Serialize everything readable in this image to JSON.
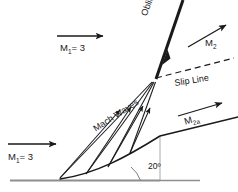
{
  "figure": {
    "background_color": "#ffffff",
    "line_color": "#1a1a1a",
    "ground_color": "#9a9a9a",
    "width": 238,
    "height": 192
  },
  "labels": {
    "mach_upstream_top": {
      "symbol": "M",
      "subscript": "1",
      "value": "= 3",
      "text": "M1 = 3"
    },
    "mach_upstream_bottom": {
      "symbol": "M",
      "subscript": "1",
      "value": "= 3",
      "text": "M1 = 3"
    },
    "mach_downstream_upper": {
      "symbol": "M",
      "subscript": "2",
      "value": "",
      "text": "M2"
    },
    "mach_downstream_lower": {
      "symbol": "M",
      "subscript": "2a",
      "value": "",
      "text": "M2a"
    },
    "oblique_shock": "Oblique shock",
    "slip_line": "Slip Line",
    "mach_waves": "Mach Waves",
    "wedge_angle": "20º"
  },
  "geometry": {
    "ground_line": {
      "x1": 10,
      "y1": 180,
      "x2": 160,
      "y2": 180
    },
    "wedge_apex": {
      "x": 60,
      "y": 179
    },
    "triple_point": {
      "x": 156,
      "y": 78
    },
    "oblique_shock_line": {
      "x1": 156,
      "y1": 78,
      "x2": 183,
      "y2": 0
    },
    "slip_line": {
      "x1": 156,
      "y1": 78,
      "x2": 234,
      "y2": 58,
      "dashed": true
    },
    "wedge_surface_end": {
      "x": 238,
      "y": 117
    },
    "mach_wave_count": 4,
    "angle_arc_vertex": {
      "x": 160,
      "y": 180
    },
    "angle_degrees": 20
  },
  "arrows": {
    "upstream_top": {
      "x1": 57,
      "y1": 36,
      "x2": 105,
      "y2": 36
    },
    "upstream_bottom": {
      "x1": 8,
      "y1": 144,
      "x2": 58,
      "y2": 144
    },
    "downstream_upper": {
      "x1": 188,
      "y1": 46,
      "x2": 228,
      "y2": 24
    },
    "downstream_lower": {
      "x1": 178,
      "y1": 116,
      "x2": 224,
      "y2": 102
    }
  }
}
